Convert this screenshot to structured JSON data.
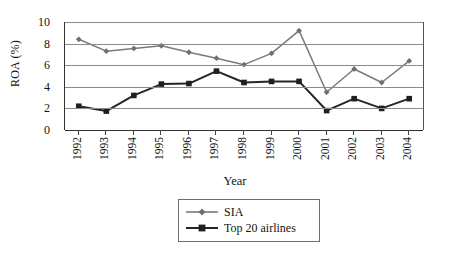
{
  "chart_data": {
    "type": "line",
    "title": "",
    "xlabel": "Year",
    "ylabel": "ROA (%)",
    "categories": [
      "1992",
      "1993",
      "1994",
      "1995",
      "1996",
      "1997",
      "1998",
      "1999",
      "2000",
      "2001",
      "2002",
      "2003",
      "2004"
    ],
    "x": [
      1992,
      1993,
      1994,
      1995,
      1996,
      1997,
      1998,
      1999,
      2000,
      2001,
      2002,
      2003,
      2004
    ],
    "ylim": [
      0,
      10
    ],
    "yticks": [
      0,
      2,
      4,
      6,
      8,
      10
    ],
    "grid": true,
    "legend_position": "bottom-center",
    "series": [
      {
        "name": "SIA",
        "marker": "diamond",
        "color": "#7a7a7a",
        "values": [
          8.4,
          7.3,
          7.55,
          7.8,
          7.2,
          6.65,
          6.05,
          7.1,
          9.2,
          3.5,
          5.65,
          4.4,
          6.4
        ]
      },
      {
        "name": "Top 20 airlines",
        "marker": "square",
        "color": "#262626",
        "values": [
          2.2,
          1.75,
          3.2,
          4.25,
          4.3,
          5.45,
          4.4,
          4.5,
          4.5,
          1.8,
          2.9,
          2.0,
          2.9
        ]
      }
    ]
  },
  "axes": {
    "ylabel": "ROA (%)",
    "xlabel": "Year",
    "ytick_labels": [
      "10",
      "8",
      "6",
      "4",
      "2",
      "0"
    ],
    "xtick_labels": [
      "1992",
      "1993",
      "1994",
      "1995",
      "1996",
      "1997",
      "1998",
      "1999",
      "2000",
      "2001",
      "2002",
      "2003",
      "2004"
    ]
  },
  "legend": {
    "items": [
      {
        "label": "SIA"
      },
      {
        "label": "Top 20 airlines"
      }
    ]
  },
  "colors": {
    "series_sia": "#7a7a7a",
    "series_top20": "#262626",
    "grid": "#8a8a8a",
    "axis": "#333333",
    "background": "#ffffff"
  }
}
